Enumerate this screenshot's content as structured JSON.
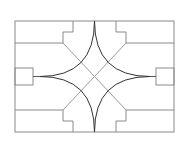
{
  "diagram": {
    "type": "line-drawing",
    "colors": {
      "background": "#ffffff",
      "frame": "#8a8a8a",
      "curve": "#333333",
      "diagonal": "#9a9a9a"
    },
    "frame": {
      "x": 15,
      "y": 21,
      "width": 159,
      "height": 111
    },
    "center": {
      "x": 94.5,
      "y": 76.5
    },
    "cusps": {
      "top": [
        94.5,
        21
      ],
      "bottom": [
        94.5,
        132
      ],
      "left": [
        40,
        76.5
      ],
      "right": [
        150,
        76.5
      ]
    },
    "side_boxes": {
      "left": {
        "x": 15,
        "y": 68,
        "width": 18,
        "height": 17
      },
      "right": {
        "x": 156,
        "y": 68,
        "width": 18,
        "height": 17
      }
    },
    "labels": []
  }
}
